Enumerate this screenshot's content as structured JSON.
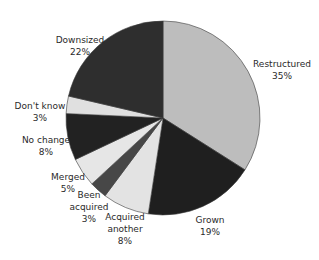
{
  "chart_data": {
    "type": "pie",
    "title": "",
    "start_angle_deg": 0,
    "direction": "clockwise",
    "categories": [
      "Restructured",
      "Grown",
      "Acquired another",
      "Been acquired",
      "Merged",
      "No change",
      "Don't know",
      "Downsized"
    ],
    "values": [
      35,
      19,
      8,
      3,
      5,
      8,
      3,
      22
    ],
    "value_labels": [
      "35%",
      "19%",
      "8%",
      "3%",
      "5%",
      "8%",
      "3%",
      "22%"
    ],
    "colors": [
      "#bdbdbd",
      "#1f1f1f",
      "#e3e3e3",
      "#474747",
      "#e6e6e6",
      "#222222",
      "#e0e0e0",
      "#2e2e2e"
    ],
    "legend": "none",
    "labels_outside": true
  },
  "labels": [
    {
      "lines": [
        "Restructured",
        "35%"
      ],
      "x": 282,
      "y": 58
    },
    {
      "lines": [
        "Grown",
        "19%"
      ],
      "x": 210,
      "y": 214
    },
    {
      "lines": [
        "Acquired",
        "another",
        "8%"
      ],
      "x": 125,
      "y": 211
    },
    {
      "lines": [
        "Been",
        "acquired",
        "3%"
      ],
      "x": 89,
      "y": 189
    },
    {
      "lines": [
        "Merged",
        "5%"
      ],
      "x": 68,
      "y": 171
    },
    {
      "lines": [
        "No change",
        "8%"
      ],
      "x": 46,
      "y": 134
    },
    {
      "lines": [
        "Don't know",
        "3%"
      ],
      "x": 40,
      "y": 100
    },
    {
      "lines": [
        "Downsized",
        "22%"
      ],
      "x": 80,
      "y": 34
    }
  ],
  "geometry": {
    "cx": 163,
    "cy": 118,
    "r": 97
  }
}
